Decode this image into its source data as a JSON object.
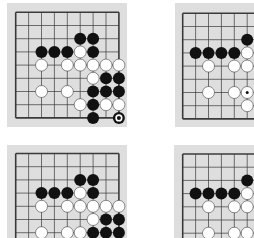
{
  "figure": {
    "colors": {
      "page_background": "#ffffff",
      "board_background": "#dedede",
      "grid_line": "#3a3a3a",
      "black_stone": "#111111",
      "white_stone": "#ffffff",
      "white_stone_outline": "#222222"
    },
    "grid": {
      "columns": 9,
      "rows": 9,
      "spacing_x": 12.9,
      "spacing_y": 13.2
    }
  },
  "boards": [
    {
      "id": "diagram-1",
      "position": "top-left",
      "bg": {
        "x": 7,
        "y": 3,
        "w": 120,
        "h": 124
      },
      "origin": {
        "x": 15.7,
        "y": 12.3
      },
      "visible_cols": 9,
      "visible_rows": 9,
      "stones": [
        {
          "c": 5,
          "r": 2,
          "color": "black"
        },
        {
          "c": 6,
          "r": 2,
          "color": "black"
        },
        {
          "c": 2,
          "r": 3,
          "color": "black"
        },
        {
          "c": 3,
          "r": 3,
          "color": "black"
        },
        {
          "c": 4,
          "r": 3,
          "color": "black"
        },
        {
          "c": 5,
          "r": 3,
          "color": "white"
        },
        {
          "c": 6,
          "r": 3,
          "color": "black"
        },
        {
          "c": 2,
          "r": 4,
          "color": "white"
        },
        {
          "c": 4,
          "r": 4,
          "color": "white"
        },
        {
          "c": 5,
          "r": 4,
          "color": "white"
        },
        {
          "c": 6,
          "r": 4,
          "color": "white"
        },
        {
          "c": 7,
          "r": 4,
          "color": "white"
        },
        {
          "c": 8,
          "r": 4,
          "color": "white"
        },
        {
          "c": 6,
          "r": 5,
          "color": "white"
        },
        {
          "c": 7,
          "r": 5,
          "color": "black"
        },
        {
          "c": 8,
          "r": 5,
          "color": "black"
        },
        {
          "c": 2,
          "r": 6,
          "color": "white"
        },
        {
          "c": 4,
          "r": 6,
          "color": "white"
        },
        {
          "c": 6,
          "r": 6,
          "color": "black"
        },
        {
          "c": 7,
          "r": 6,
          "color": "black"
        },
        {
          "c": 8,
          "r": 6,
          "color": "black"
        },
        {
          "c": 5,
          "r": 7,
          "color": "white"
        },
        {
          "c": 6,
          "r": 7,
          "color": "black"
        },
        {
          "c": 7,
          "r": 7,
          "color": "white"
        },
        {
          "c": 8,
          "r": 7,
          "color": "white"
        },
        {
          "c": 6,
          "r": 8,
          "color": "black"
        },
        {
          "c": 8,
          "r": 8,
          "color": "black",
          "marker": "circle"
        }
      ]
    },
    {
      "id": "diagram-2",
      "position": "top-right",
      "bg": {
        "x": 175,
        "y": 3,
        "w": 85,
        "h": 124
      },
      "origin": {
        "x": 182.7,
        "y": 13.3
      },
      "visible_cols": 6,
      "visible_rows": 9,
      "stones": [
        {
          "c": 5,
          "r": 2,
          "color": "black"
        },
        {
          "c": 1,
          "r": 3,
          "color": "black"
        },
        {
          "c": 2,
          "r": 3,
          "color": "black"
        },
        {
          "c": 3,
          "r": 3,
          "color": "black"
        },
        {
          "c": 4,
          "r": 3,
          "color": "black"
        },
        {
          "c": 5,
          "r": 3,
          "color": "white"
        },
        {
          "c": 2,
          "r": 4,
          "color": "white"
        },
        {
          "c": 4,
          "r": 4,
          "color": "white"
        },
        {
          "c": 5,
          "r": 4,
          "color": "white"
        },
        {
          "c": 2,
          "r": 6,
          "color": "white"
        },
        {
          "c": 4,
          "r": 6,
          "color": "white"
        },
        {
          "c": 5,
          "r": 6,
          "color": "white",
          "marker": "dot"
        },
        {
          "c": 5,
          "r": 7,
          "color": "white"
        }
      ]
    },
    {
      "id": "diagram-3",
      "position": "bottom-left",
      "bg": {
        "x": 7,
        "y": 145,
        "w": 120,
        "h": 100
      },
      "origin": {
        "x": 15.7,
        "y": 153.5
      },
      "visible_cols": 9,
      "visible_rows": 7,
      "stones": [
        {
          "c": 5,
          "r": 2,
          "color": "black"
        },
        {
          "c": 6,
          "r": 2,
          "color": "black"
        },
        {
          "c": 2,
          "r": 3,
          "color": "black"
        },
        {
          "c": 3,
          "r": 3,
          "color": "black"
        },
        {
          "c": 4,
          "r": 3,
          "color": "black"
        },
        {
          "c": 5,
          "r": 3,
          "color": "white"
        },
        {
          "c": 6,
          "r": 3,
          "color": "black"
        },
        {
          "c": 2,
          "r": 4,
          "color": "white"
        },
        {
          "c": 4,
          "r": 4,
          "color": "white"
        },
        {
          "c": 5,
          "r": 4,
          "color": "white"
        },
        {
          "c": 6,
          "r": 4,
          "color": "white"
        },
        {
          "c": 7,
          "r": 4,
          "color": "white"
        },
        {
          "c": 8,
          "r": 4,
          "color": "white"
        },
        {
          "c": 6,
          "r": 5,
          "color": "white"
        },
        {
          "c": 7,
          "r": 5,
          "color": "black"
        },
        {
          "c": 8,
          "r": 5,
          "color": "black"
        },
        {
          "c": 2,
          "r": 6,
          "color": "white"
        },
        {
          "c": 4,
          "r": 6,
          "color": "white"
        },
        {
          "c": 5,
          "r": 6,
          "color": "white"
        },
        {
          "c": 6,
          "r": 6,
          "color": "black"
        },
        {
          "c": 7,
          "r": 6,
          "color": "black"
        },
        {
          "c": 8,
          "r": 6,
          "color": "black"
        }
      ]
    },
    {
      "id": "diagram-4",
      "position": "bottom-right",
      "bg": {
        "x": 174,
        "y": 145,
        "w": 85,
        "h": 100
      },
      "origin": {
        "x": 182.7,
        "y": 154
      },
      "visible_cols": 6,
      "visible_rows": 7,
      "stones": [
        {
          "c": 5,
          "r": 2,
          "color": "black"
        },
        {
          "c": 1,
          "r": 3,
          "color": "black"
        },
        {
          "c": 2,
          "r": 3,
          "color": "black"
        },
        {
          "c": 3,
          "r": 3,
          "color": "black"
        },
        {
          "c": 4,
          "r": 3,
          "color": "black"
        },
        {
          "c": 5,
          "r": 3,
          "color": "white"
        },
        {
          "c": 2,
          "r": 4,
          "color": "white"
        },
        {
          "c": 4,
          "r": 4,
          "color": "white"
        },
        {
          "c": 5,
          "r": 4,
          "color": "white"
        },
        {
          "c": 2,
          "r": 6,
          "color": "white"
        },
        {
          "c": 4,
          "r": 6,
          "color": "white"
        },
        {
          "c": 5,
          "r": 6,
          "color": "white"
        }
      ]
    }
  ]
}
